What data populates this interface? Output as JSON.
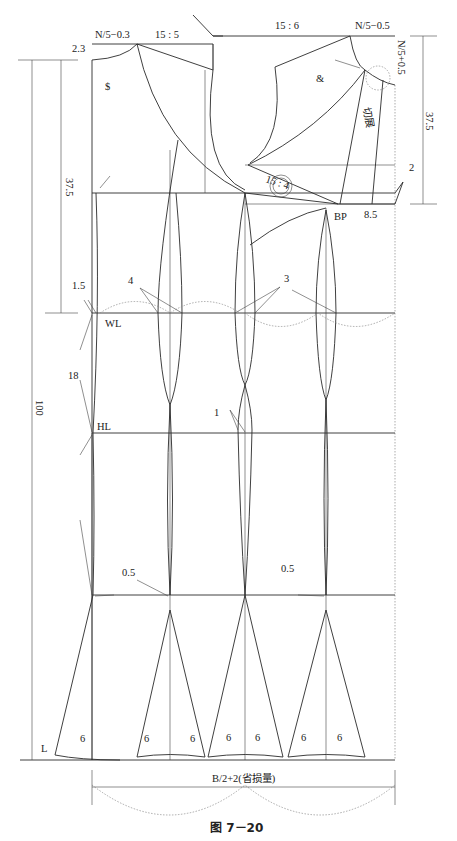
{
  "figure": {
    "caption": "图 7－20",
    "top_labels": {
      "neck_width_back": "N/5−0.3",
      "shoulder_slope_back": "15 : 5",
      "shoulder_slope_front": "15 : 6",
      "neck_width_front": "N/5−0.5",
      "neck_depth_front": "N/5+0.5",
      "back_neck_rise": "2.3"
    },
    "marks": {
      "back_neck_curve": "$",
      "front_neck_curve": "&",
      "cut_open": "切展",
      "dart_ratio": "15 : 4",
      "bp": "BP",
      "bp_offset": "8.5",
      "front_drop": "2"
    },
    "dimensions": {
      "back_waist_length": "37.5",
      "front_waist_length": "37.5",
      "total_length": "100",
      "waist_to_hip": "18",
      "waist_offset": "1.5",
      "width_label": "B/2+2(省损量)"
    },
    "lines": {
      "waist": "WL",
      "hip": "HL",
      "hem": "L"
    },
    "dart_labels": {
      "dart_a": "4",
      "dart_b": "3",
      "dart_c": "1",
      "flare_left": "0.5",
      "flare_right": "0.5"
    },
    "hem_flare": [
      "6",
      "6",
      "6",
      "6",
      "6",
      "6",
      "6"
    ]
  }
}
